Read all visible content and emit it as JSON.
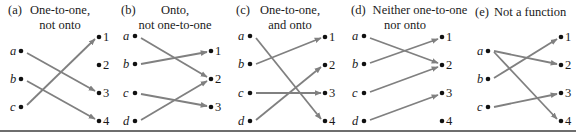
{
  "figure": {
    "panels": [
      {
        "id": "a",
        "tag": "(a)",
        "title_lines": [
          "One-to-one,",
          "not onto"
        ],
        "domain": [
          "a",
          "b",
          "c"
        ],
        "codomain": [
          "1",
          "2",
          "3",
          "4"
        ],
        "mappings": [
          [
            "a",
            "3"
          ],
          [
            "b",
            "4"
          ],
          [
            "c",
            "1"
          ]
        ]
      },
      {
        "id": "b",
        "tag": "(b)",
        "title_lines": [
          "Onto,",
          "not one-to-one"
        ],
        "domain": [
          "a",
          "b",
          "c",
          "d"
        ],
        "codomain": [
          "1",
          "2",
          "3"
        ],
        "mappings": [
          [
            "a",
            "2"
          ],
          [
            "b",
            "1"
          ],
          [
            "c",
            "3"
          ],
          [
            "d",
            "2"
          ]
        ]
      },
      {
        "id": "c",
        "tag": "(c)",
        "title_lines": [
          "One-to-one,",
          "and onto"
        ],
        "domain": [
          "a",
          "b",
          "c",
          "d"
        ],
        "codomain": [
          "1",
          "2",
          "3",
          "4"
        ],
        "mappings": [
          [
            "a",
            "4"
          ],
          [
            "b",
            "1"
          ],
          [
            "c",
            "3"
          ],
          [
            "d",
            "2"
          ]
        ]
      },
      {
        "id": "d",
        "tag": "(d)",
        "title_lines": [
          "Neither one-to-one",
          "nor onto"
        ],
        "domain": [
          "a",
          "b",
          "c",
          "d"
        ],
        "codomain": [
          "1",
          "2",
          "3",
          "4"
        ],
        "mappings": [
          [
            "a",
            "2"
          ],
          [
            "b",
            "1"
          ],
          [
            "c",
            "2"
          ],
          [
            "d",
            "3"
          ]
        ]
      },
      {
        "id": "e",
        "tag": "(e)",
        "title_lines": [
          "Not a function"
        ],
        "domain": [
          "a",
          "b",
          "c"
        ],
        "codomain": [
          "1",
          "2",
          "3",
          "4"
        ],
        "mappings": [
          [
            "a",
            "2"
          ],
          [
            "a",
            "4"
          ],
          [
            "b",
            "1"
          ],
          [
            "c",
            "3"
          ]
        ]
      }
    ],
    "colors": {
      "arrow": "#808080",
      "dot": "#111111",
      "text": "#1a1a1a",
      "rule": "#6e6e6e"
    }
  }
}
